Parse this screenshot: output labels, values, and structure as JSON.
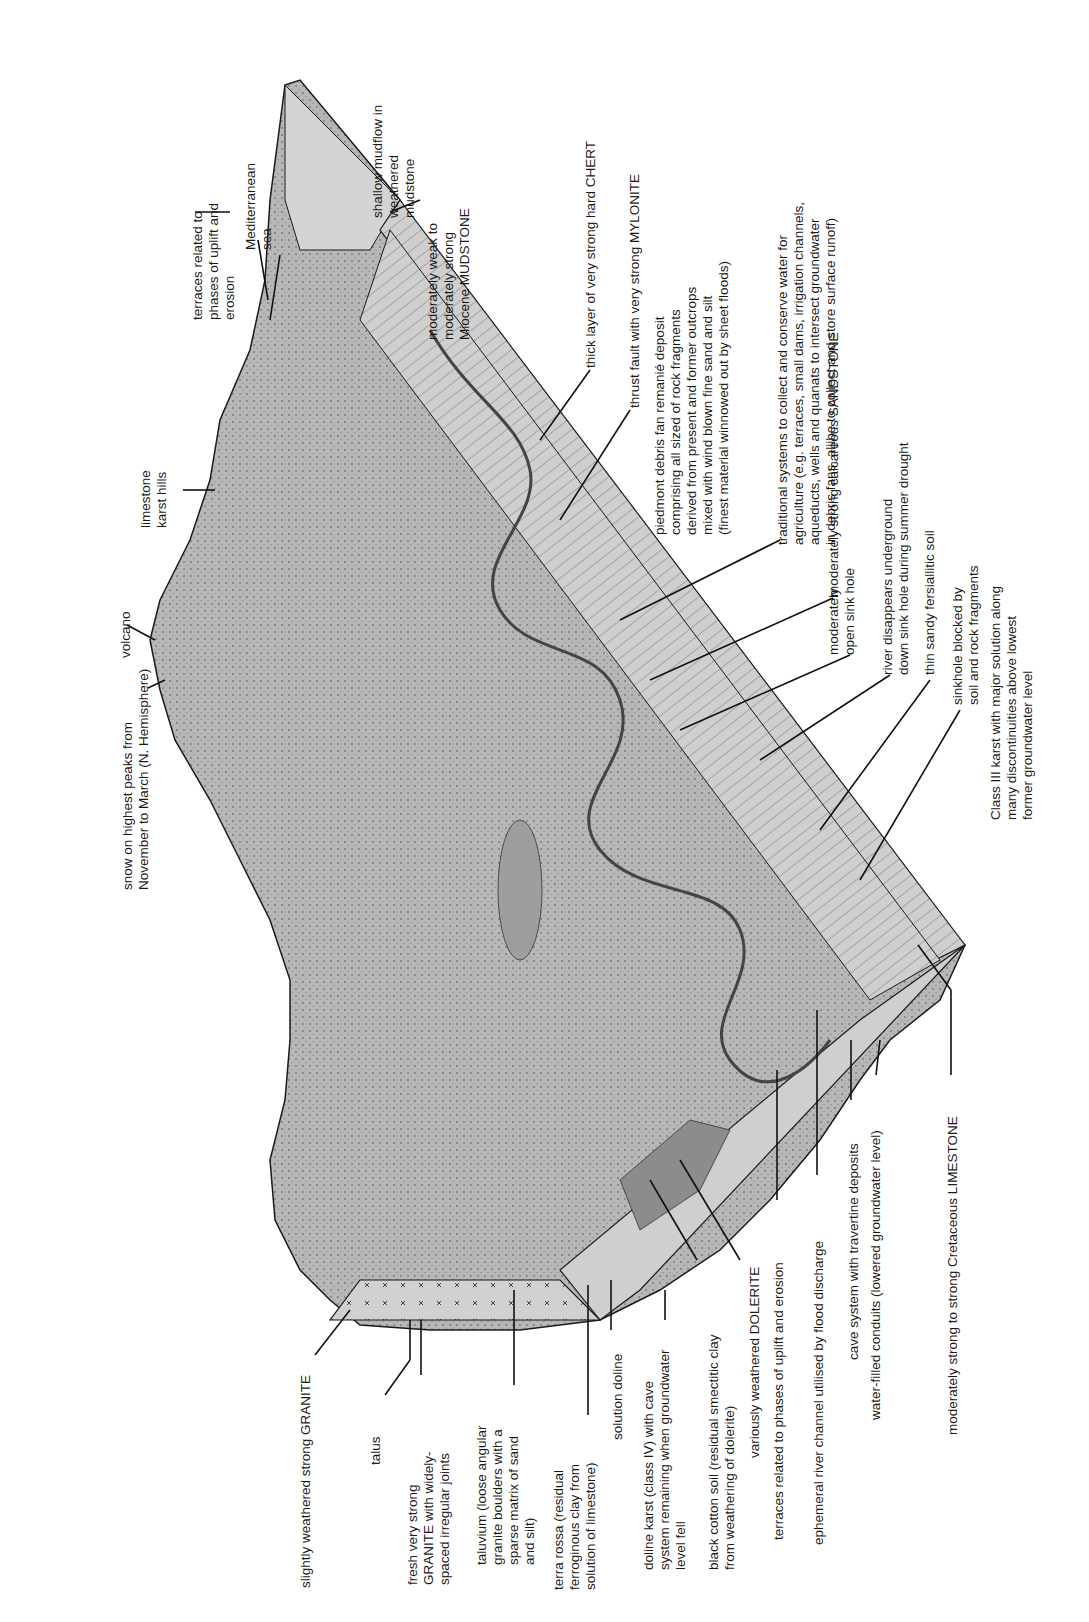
{
  "diagram": {
    "type": "geological block diagram (rotated 90° counter-clockwise)",
    "colors": {
      "terrain_fill": "#b9b9b9",
      "terrain_dark": "#8c8c8c",
      "outline": "#1a1a1a",
      "background": "#ffffff",
      "sea_fill": "#d4d4d4"
    },
    "labels": {
      "slightly_weathered_granite": "slightly weathered strong GRANITE",
      "talus": "talus",
      "fresh_granite": "fresh very strong\nGRANITE with widely-\nspaced irregular joints",
      "taluvium": "taluvium (loose angular\ngranite boulders with a\nsparse matrix of sand\nand silt)",
      "terra_rossa": "terra rossa (residual\nferroginous clay from\nsolution of limestone)",
      "solution_doline": "solution doline",
      "doline_karst": "doline karst (class IV) with cave\nsystem remaining when groundwater\nlevel fell",
      "black_cotton_soil": "black cotton soil (residual smectitic clay\nfrom weathering of dolerite)",
      "dolerite": "variously weathered DOLERITE",
      "terraces_lower": "terraces related to phases of uplift and erosion",
      "ephemeral_river": "ephemeral river channel utilised by flood discharge",
      "cave_system": "cave system with travertine deposits",
      "water_conduits": "water-filled conduits (lowered groundwater level)",
      "limestone": "moderately strong to strong Cretaceous LIMESTONE",
      "snow": "snow on highest peaks from\nNovember to March (N. Hemisphere)",
      "volcano": "volcano",
      "karst_hills": "limestone\nkarst hills",
      "terraces_upper": "terraces related to\nphases of uplift and\nerosion",
      "sea": "Mediterranean\nsea",
      "mudflow": "shallow mudflow in\nweathered\nmudstone",
      "mudstone": "moderately weak to\nmoderately strong\nMiocene MUDSTONE",
      "chert": "thick layer of very strong hard CHERT",
      "mylonite": "thrust fault with very strong MYLONITE",
      "piedmont": "piedmont debris fan remanié deposit\ncomprising all sized of rock fragments\nderived from present and former outcrops\nmixed with wind blown fine sand and silt\n(finest material winnowed out by sheet floods)",
      "traditional_systems": "traditional systems to collect and conserve water for\nagriculture (e.g. terraces, small dams, irrigation channels,\naqueducts, wells and quanats to intersect groundwater\nin debris fans, aljibe to collect and store surface runoff)",
      "sandstone": "moderately strong calcareous SANDSTONE",
      "open_sink_hole": "moderately\nopen sink hole",
      "river_disappears": "river disappears underground\ndown sink hole during summer drought",
      "fersiallitic_soil": "thin sandy fersiallitic soil",
      "sinkhole_blocked": "sinkhole blocked by\nsoil and rock fragments",
      "class_iii_karst": "Class III karst with major solution along\nmany discontinuities above lowest\nformer groundwater level"
    }
  }
}
